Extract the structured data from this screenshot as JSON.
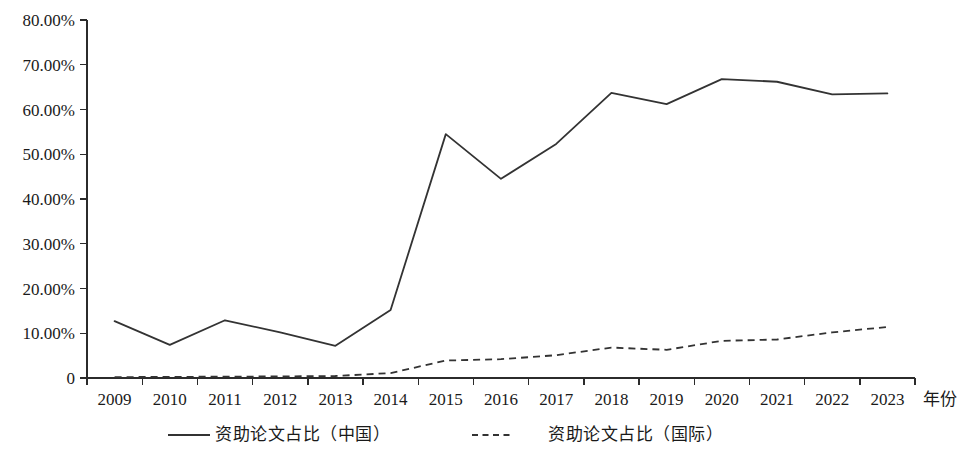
{
  "chart_data": {
    "type": "line",
    "title": "",
    "xlabel": "年份",
    "ylabel": "",
    "categories": [
      "2009",
      "2010",
      "2011",
      "2012",
      "2013",
      "2014",
      "2015",
      "2016",
      "2017",
      "2018",
      "2019",
      "2020",
      "2021",
      "2022",
      "2023"
    ],
    "ylim": [
      0,
      80
    ],
    "ytick_values": [
      0,
      10,
      20,
      30,
      40,
      50,
      60,
      70,
      80
    ],
    "ytick_labels": [
      "0",
      "10.00%",
      "20.00%",
      "30.00%",
      "40.00%",
      "50.00%",
      "60.00%",
      "70.00%",
      "80.00%"
    ],
    "grid": false,
    "legend_position": "bottom",
    "series": [
      {
        "name": "资助论文占比（中国）",
        "style": "solid",
        "color": "#333333",
        "values": [
          12.7,
          7.4,
          12.9,
          10.2,
          7.2,
          15.2,
          54.5,
          44.5,
          52.3,
          63.7,
          61.2,
          66.8,
          66.2,
          63.4,
          63.6
        ]
      },
      {
        "name": "资助论文占比（国际）",
        "style": "dashed",
        "color": "#333333",
        "values": [
          0.2,
          0.25,
          0.3,
          0.35,
          0.45,
          1.1,
          3.9,
          4.2,
          5.1,
          6.8,
          6.3,
          8.3,
          8.6,
          10.2,
          11.4
        ]
      }
    ]
  },
  "legend": {
    "items": [
      {
        "label": "资助论文占比（中国）",
        "style": "solid"
      },
      {
        "label": "资助论文占比（国际）",
        "style": "dashed"
      }
    ]
  },
  "axes": {
    "x_axis_title": "年份"
  }
}
